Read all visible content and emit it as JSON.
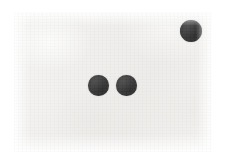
{
  "scene": {
    "width": 226,
    "height": 168,
    "description": "Three dark filled circles on an off-white scanned paper background",
    "page_background": "#ffffff",
    "paper_color": "#f0efed",
    "paper": {
      "x": 14,
      "y": 12,
      "width": 198,
      "height": 140
    }
  },
  "marks": {
    "count": 3,
    "color": "#3a3a3a",
    "shape": "circle",
    "items": [
      {
        "id": "dot-top-right",
        "cx": 191,
        "cy": 31,
        "diameter": 22,
        "color": "#3a3a3a"
      },
      {
        "id": "dot-center-left",
        "cx": 98.5,
        "cy": 85.5,
        "diameter": 21,
        "color": "#3a3a3a"
      },
      {
        "id": "dot-center-right",
        "cx": 126.5,
        "cy": 85.5,
        "diameter": 21,
        "color": "#3b3b3b"
      }
    ]
  }
}
